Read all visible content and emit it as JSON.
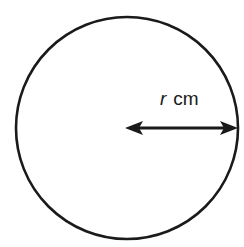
{
  "diagram": {
    "type": "circle-radius",
    "label": {
      "variable": "r",
      "unit": "cm"
    },
    "colors": {
      "stroke": "#1a1a1a",
      "background": "#ffffff"
    }
  }
}
